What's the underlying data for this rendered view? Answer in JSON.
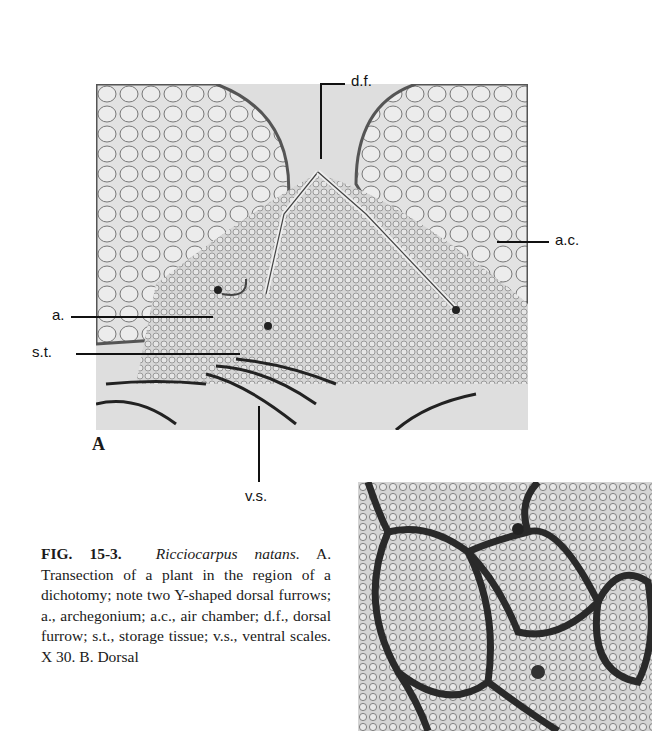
{
  "figure": {
    "panel_a": {
      "label": "A",
      "annotations": {
        "df": "d.f.",
        "ac": "a.c.",
        "a": "a.",
        "st": "s.t.",
        "vs": "v.s."
      }
    },
    "caption": {
      "fig_number": "FIG. 15-3.",
      "species": "Ricciocarpus natans.",
      "lines": [
        "A. Transection of a plant in the region of a dichotomy; note two Y-shaped dorsal furrows; a., archegonium; a.c., air chamber; d.f., dorsal furrow; s.t., storage tissue; v.s., ventral scales. X 30. B. Dorsal"
      ]
    }
  }
}
